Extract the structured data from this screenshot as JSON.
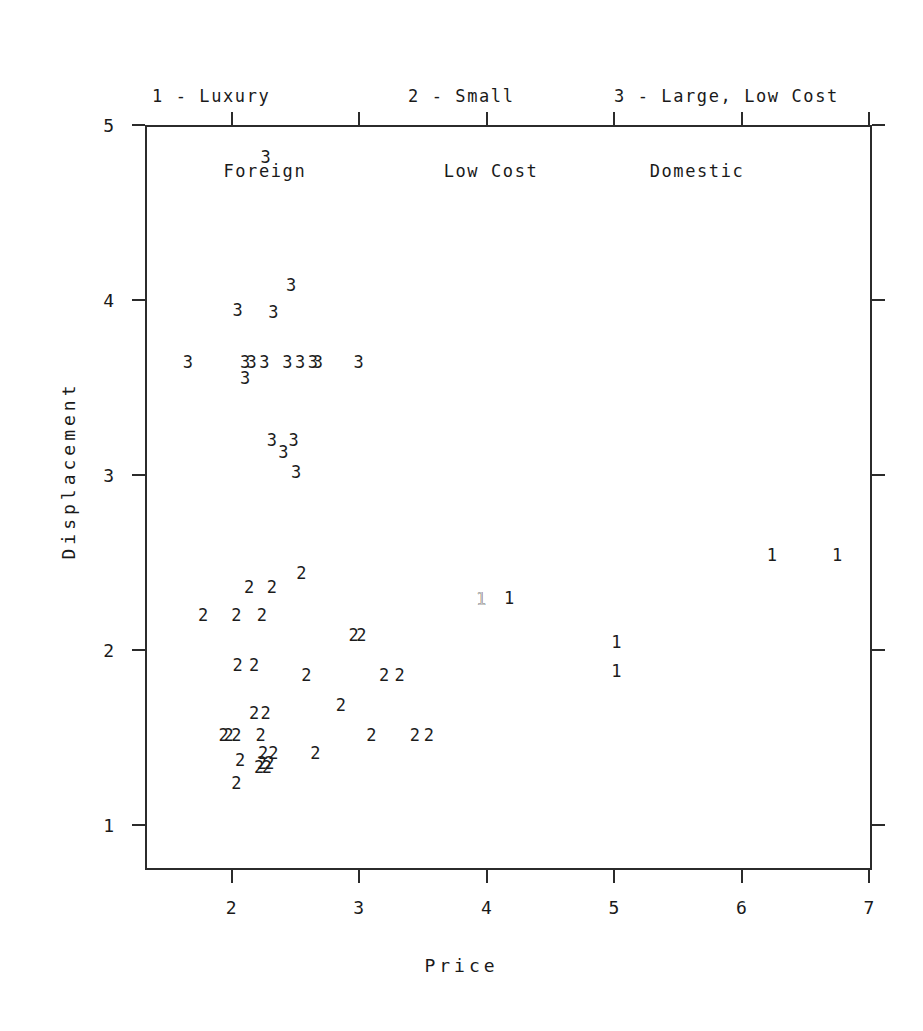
{
  "chart_data": {
    "type": "scatter",
    "title": "",
    "xlabel": "Price",
    "ylabel": "Displacement",
    "xlim": [
      1.32,
      7.02
    ],
    "ylim": [
      0.745,
      5.0
    ],
    "xticks": [
      2,
      3,
      4,
      5,
      6,
      7
    ],
    "xticklabels": [
      "2",
      "3",
      "4",
      "5",
      "6",
      "7"
    ],
    "yticks": [
      1,
      2,
      3,
      4,
      5
    ],
    "yticklabels": [
      "1",
      "2",
      "3",
      "4",
      "5"
    ],
    "grid": false,
    "legend_position": "above-plot",
    "marker_style": "group-number-as-text",
    "series": [
      {
        "name": "1 - Luxury Foreign",
        "marker": "1",
        "points": [
          [
            6.22,
            2.555
          ],
          [
            6.73,
            2.555
          ],
          [
            4.16,
            2.31
          ],
          [
            5.0,
            2.06
          ],
          [
            5.0,
            1.895
          ],
          [
            3.94,
            2.305
          ]
        ]
      },
      {
        "name": "2 - Small Low Cost",
        "marker": "2",
        "points": [
          [
            2.53,
            2.45
          ],
          [
            2.12,
            2.37
          ],
          [
            2.3,
            2.37
          ],
          [
            1.76,
            2.21
          ],
          [
            2.02,
            2.21
          ],
          [
            2.22,
            2.21
          ],
          [
            2.94,
            2.1
          ],
          [
            3.0,
            2.1
          ],
          [
            2.03,
            1.93
          ],
          [
            2.16,
            1.93
          ],
          [
            2.57,
            1.87
          ],
          [
            3.18,
            1.87
          ],
          [
            3.3,
            1.87
          ],
          [
            2.84,
            1.7
          ],
          [
            2.16,
            1.655
          ],
          [
            2.25,
            1.655
          ],
          [
            1.92,
            1.53
          ],
          [
            1.96,
            1.53
          ],
          [
            2.02,
            1.53
          ],
          [
            2.21,
            1.53
          ],
          [
            3.08,
            1.53
          ],
          [
            3.42,
            1.53
          ],
          [
            3.53,
            1.53
          ],
          [
            2.23,
            1.425
          ],
          [
            2.31,
            1.425
          ],
          [
            2.64,
            1.425
          ],
          [
            2.05,
            1.385
          ],
          [
            2.22,
            1.37
          ],
          [
            2.28,
            1.37
          ],
          [
            2.2,
            1.345
          ],
          [
            2.26,
            1.345
          ],
          [
            2.02,
            1.255
          ]
        ]
      },
      {
        "name": "3 - Large, Low Cost Domestic",
        "marker": "3",
        "points": [
          [
            2.57,
            5.045
          ],
          [
            2.25,
            4.83
          ],
          [
            2.45,
            4.095
          ],
          [
            2.03,
            3.955
          ],
          [
            2.31,
            3.945
          ],
          [
            1.64,
            3.66
          ],
          [
            2.09,
            3.66
          ],
          [
            2.14,
            3.66
          ],
          [
            2.24,
            3.66
          ],
          [
            2.42,
            3.66
          ],
          [
            2.52,
            3.66
          ],
          [
            2.62,
            3.66
          ],
          [
            2.66,
            3.66
          ],
          [
            2.98,
            3.66
          ],
          [
            2.09,
            3.565
          ],
          [
            2.3,
            3.21
          ],
          [
            2.47,
            3.215
          ],
          [
            2.39,
            3.145
          ],
          [
            2.49,
            3.03
          ]
        ]
      }
    ]
  },
  "legend": [
    {
      "line1": "1 - Luxury",
      "line2": "Foreign"
    },
    {
      "line1": "2 - Small",
      "line2": "Low Cost"
    },
    {
      "line1": "3 - Large, Low Cost",
      "line2": "Domestic"
    }
  ],
  "axes": {
    "x_title": "Price",
    "y_title": "Displacement"
  }
}
